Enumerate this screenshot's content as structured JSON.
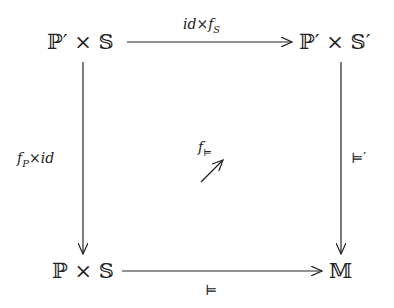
{
  "diagram": {
    "type": "commutative-square",
    "nodes": {
      "top_left": "ℙ′ × 𝕊",
      "top_right": "ℙ′ × 𝕊′",
      "bottom_left": "ℙ × 𝕊",
      "bottom_right": "𝕄"
    },
    "arrows": {
      "top": {
        "from": "top_left",
        "to": "top_right",
        "label_main": "id×f",
        "label_sub": "S"
      },
      "left": {
        "from": "top_left",
        "to": "bottom_left",
        "label_main": "f",
        "label_sub": "P",
        "label_rest": "×id"
      },
      "right": {
        "from": "top_right",
        "to": "bottom_right",
        "label": "⊨′"
      },
      "bottom": {
        "from": "bottom_left",
        "to": "bottom_right",
        "label": "⊨"
      },
      "center": {
        "label_main": "f",
        "label_sub": "⊨",
        "direction": "north-east"
      }
    }
  }
}
